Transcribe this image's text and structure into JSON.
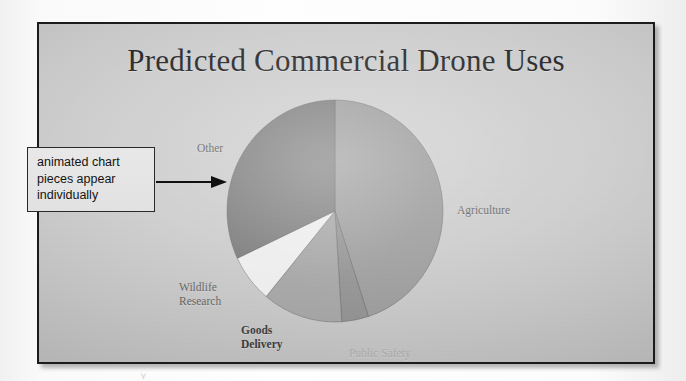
{
  "slide": {
    "title": "Predicted Commercial Drone Uses",
    "background_color": "#c9c9c9",
    "border_color": "#1c1c1c"
  },
  "callout": {
    "line1": "animated chart",
    "line2": "pieces appear",
    "line3": "individually",
    "arrow_direction": "right",
    "border_color": "#2a2a2a",
    "fill_color": "#e6e6e6"
  },
  "labels": {
    "other": "Other",
    "agriculture": "Agriculture",
    "wildlife": "Wildlife\nResearch",
    "goods": "Goods\nDelivery",
    "public_safety": "Public Safety"
  },
  "scan_mark": "⋎",
  "chart_data": {
    "type": "pie",
    "title": "Predicted Commercial Drone Uses",
    "categories": [
      "Agriculture",
      "Public Safety",
      "Goods Delivery",
      "Wildlife Research",
      "Other"
    ],
    "values": [
      45,
      4,
      12,
      7,
      32
    ],
    "unit": "percent",
    "labels_shown": [
      "Agriculture",
      "Public Safety",
      "Goods Delivery",
      "Wildlife Research",
      "Other"
    ],
    "start_angle_deg": 0,
    "direction": "clockwise",
    "colors": [
      "#9a9a9a",
      "#8f8f8f",
      "#a3a3a3",
      "#f1f1f1",
      "#777777"
    ],
    "legend": "none",
    "grid": false,
    "exploded": false
  }
}
